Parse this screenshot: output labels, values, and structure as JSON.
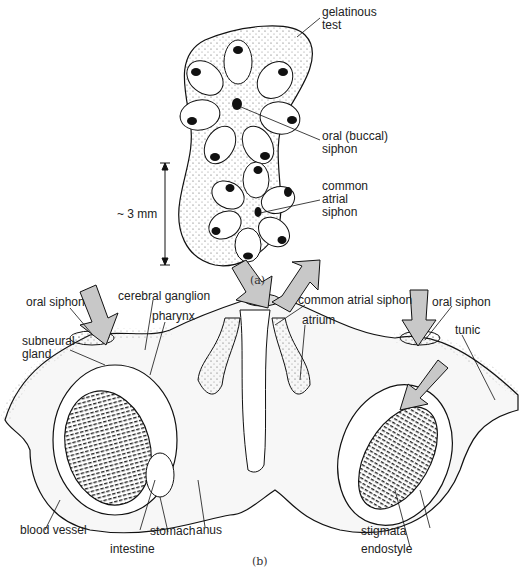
{
  "figure": {
    "panel_a": {
      "caption": "(a)",
      "labels": {
        "gelatinous_test": "gelatinous\ntest",
        "oral_siphon": "oral (buccal)\nsiphon",
        "common_atrial_siphon": "common\natrial\nsiphon",
        "scale": "~ 3 mm"
      }
    },
    "panel_b": {
      "caption": "(b)",
      "labels": {
        "oral_siphon_left": "oral siphon",
        "cerebral_ganglion": "cerebral ganglion",
        "common_atrial_siphon": "common atrial siphon",
        "oral_siphon_right": "oral siphon",
        "pharynx": "pharynx",
        "atrium": "atrium",
        "subneural_gland": "subneural\ngland",
        "tunic": "tunic",
        "blood_vessel": "blood vessel",
        "stomach": "stomach",
        "anus": "anus",
        "intestine": "intestine",
        "stigmata": "stigmata",
        "endostyle": "endostyle"
      }
    }
  }
}
